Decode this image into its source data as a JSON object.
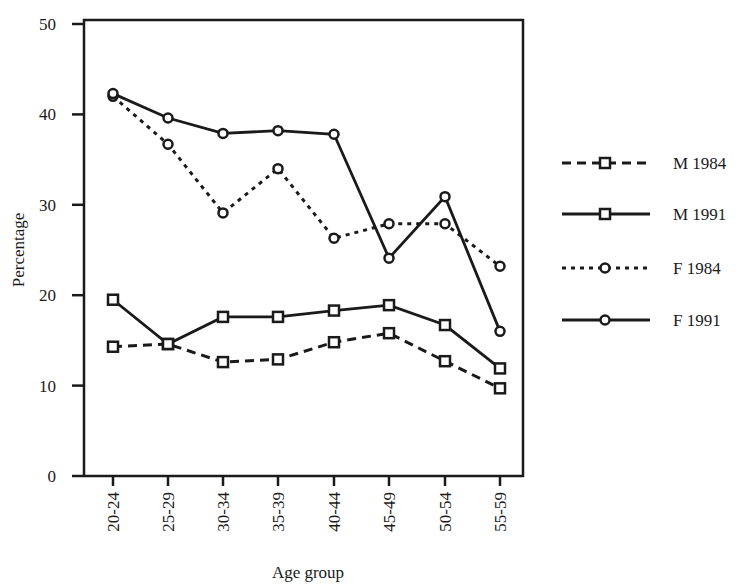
{
  "chart_data": {
    "type": "line",
    "title": "",
    "xlabel": "Age group",
    "ylabel": "Percentage",
    "ylim": [
      0,
      50
    ],
    "yticks": [
      0,
      10,
      20,
      30,
      40,
      50
    ],
    "grid": false,
    "legend_position": "right",
    "categories": [
      "20-24",
      "25-29",
      "30-34",
      "35-39",
      "40-44",
      "45-49",
      "50-54",
      "55-59"
    ],
    "series": [
      {
        "name": "M 1984",
        "marker": "square",
        "line": "dashed",
        "values": [
          14.3,
          14.6,
          12.6,
          12.9,
          14.8,
          15.8,
          12.7,
          9.7
        ]
      },
      {
        "name": "M 1991",
        "marker": "square",
        "line": "solid",
        "values": [
          19.5,
          14.6,
          17.6,
          17.6,
          18.3,
          18.9,
          16.7,
          11.9
        ]
      },
      {
        "name": "F 1984",
        "marker": "circle",
        "line": "dotted",
        "values": [
          42.0,
          36.7,
          29.1,
          34.0,
          26.3,
          27.9,
          27.9,
          23.2
        ]
      },
      {
        "name": "F 1991",
        "marker": "circle",
        "line": "solid",
        "values": [
          42.3,
          39.6,
          37.9,
          38.2,
          37.8,
          24.1,
          30.9,
          16.0
        ]
      }
    ]
  },
  "colors": {
    "ink": "#1a1a1a",
    "background": "#ffffff"
  }
}
